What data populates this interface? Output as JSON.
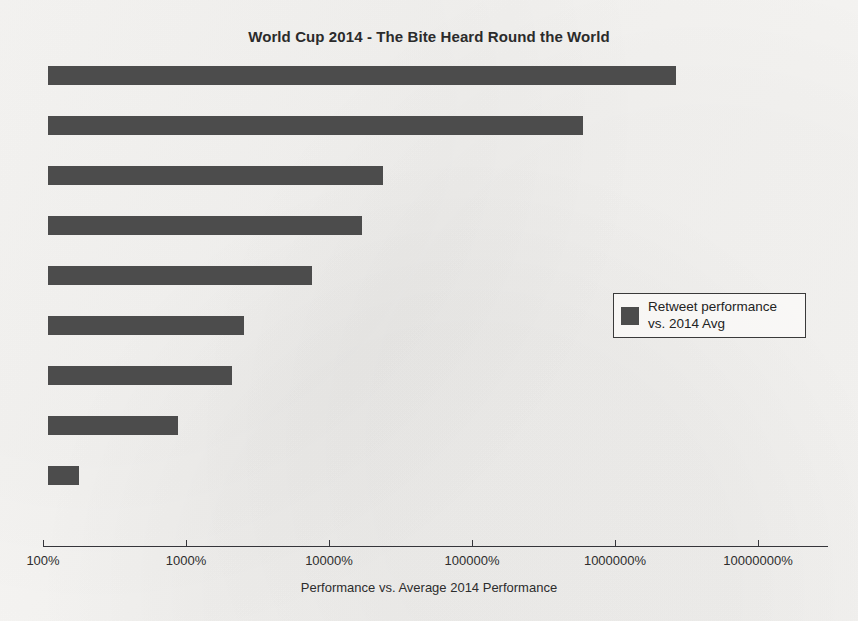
{
  "chart_data": {
    "type": "bar",
    "orientation": "horizontal",
    "title": "World Cup 2014 - The Bite Heard Round the World",
    "xlabel": "Performance vs. Average 2014 Performance",
    "ylabel": "",
    "xscale": "log",
    "xlim": [
      100,
      30000000
    ],
    "grid": false,
    "legend_position": "center-right",
    "categories": [
      "",
      "",
      "",
      "",
      "",
      "",
      "",
      "",
      ""
    ],
    "values": [
      2570000,
      610000,
      22000,
      15500,
      7200,
      2500,
      2100,
      880,
      170
    ],
    "series": [
      {
        "name": "Retweet performance vs. 2014 Avg",
        "values": [
          2570000,
          610000,
          22000,
          15500,
          7200,
          2500,
          2100,
          880,
          170
        ]
      }
    ],
    "xticks": [
      100,
      1000,
      10000,
      100000,
      1000000,
      10000000
    ],
    "xtick_labels": [
      "100%",
      "1000%",
      "10000%",
      "100000%",
      "1000000%",
      "10000000%"
    ],
    "bar_color": "#4c4c4c"
  },
  "legend": {
    "label": "Retweet performance vs. 2014 Avg",
    "swatch_color": "#4c4c4c"
  },
  "axis": {
    "x_title": "Performance vs. Average 2014 Performance"
  },
  "bars": [
    {
      "value": 2570000,
      "pixel_end": 676
    },
    {
      "value": 610000,
      "pixel_end": 583
    },
    {
      "value": 22000,
      "pixel_end": 383
    },
    {
      "value": 15500,
      "pixel_end": 362
    },
    {
      "value": 7200,
      "pixel_end": 312
    },
    {
      "value": 2500,
      "pixel_end": 244
    },
    {
      "value": 2100,
      "pixel_end": 232
    },
    {
      "value": 880,
      "pixel_end": 178
    },
    {
      "value": 170,
      "pixel_end": 79
    }
  ]
}
